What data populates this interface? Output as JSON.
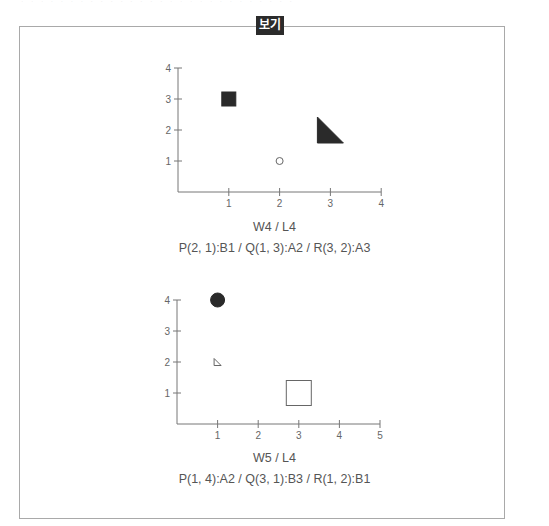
{
  "header": {
    "clipped_text": "· · ·  · · · · ·  · · · · · · · · ·  · · · · · · · · · · ·"
  },
  "box": {
    "label": "보기"
  },
  "chart_data": [
    {
      "type": "scatter",
      "title": "",
      "xlim": [
        0,
        4
      ],
      "ylim": [
        0,
        4
      ],
      "x_ticks": [
        "1",
        "2",
        "3",
        "4"
      ],
      "y_ticks": [
        "1",
        "2",
        "3",
        "4"
      ],
      "grid": false,
      "points": [
        {
          "name": "P",
          "x": 2,
          "y": 1,
          "code": "B1",
          "shape": "circle",
          "fill": "hollow",
          "size": "small"
        },
        {
          "name": "Q",
          "x": 1,
          "y": 3,
          "code": "A2",
          "shape": "square",
          "fill": "filled",
          "size": "medium"
        },
        {
          "name": "R",
          "x": 3,
          "y": 2,
          "code": "A3",
          "shape": "triangle",
          "fill": "filled",
          "size": "large"
        }
      ],
      "caption_line1": "W4 / L4",
      "caption_line2": "P(2,  1):B1 / Q(1,  3):A2 / R(3,  2):A3"
    },
    {
      "type": "scatter",
      "title": "",
      "xlim": [
        0,
        5
      ],
      "ylim": [
        0,
        4
      ],
      "x_ticks": [
        "1",
        "2",
        "3",
        "4",
        "5"
      ],
      "y_ticks": [
        "1",
        "2",
        "3",
        "4"
      ],
      "grid": false,
      "points": [
        {
          "name": "P",
          "x": 1,
          "y": 4,
          "code": "A2",
          "shape": "circle",
          "fill": "filled",
          "size": "medium"
        },
        {
          "name": "Q",
          "x": 3,
          "y": 1,
          "code": "B3",
          "shape": "square",
          "fill": "hollow",
          "size": "large"
        },
        {
          "name": "R",
          "x": 1,
          "y": 2,
          "code": "B1",
          "shape": "triangle",
          "fill": "hollow",
          "size": "small"
        }
      ],
      "caption_line1": "W5 / L4",
      "caption_line2": "P(1,  4):A2 / Q(3,  1):B3 / R(1,  2):B1"
    }
  ]
}
